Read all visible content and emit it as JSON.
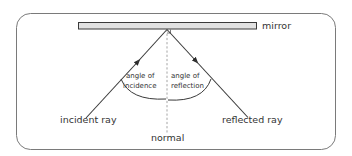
{
  "diagram": {
    "labels": {
      "mirror": "mirror",
      "incident_ray": "incident ray",
      "reflected_ray": "reflected ray",
      "normal": "normal",
      "angle_of_incidence_line1": "angle of",
      "angle_of_incidence_line2": "incidence",
      "angle_of_reflection_line1": "angle of",
      "angle_of_reflection_line2": "reflection"
    },
    "colors": {
      "frame": "#7a7a7a",
      "mirror_fill": "#e2e2e2",
      "mirror_stroke": "#3a3a3a",
      "ray": "#3a3a3a",
      "normal": "#9a9a9a",
      "text": "#333333"
    }
  }
}
